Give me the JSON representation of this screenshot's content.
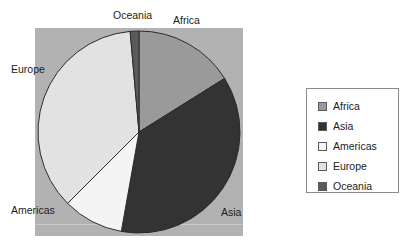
{
  "chart_data": {
    "type": "pie",
    "title": "",
    "labels": [
      "Africa",
      "Asia",
      "Americas",
      "Europe",
      "Oceania"
    ],
    "values": [
      16.1,
      36.7,
      9.7,
      36.1,
      1.4
    ],
    "unit": "percent",
    "start_angle_deg": 0,
    "direction": "clockwise",
    "colors": [
      "#9a9a9a",
      "#333333",
      "#f4f4f4",
      "#e2e2e2",
      "#5a5a5a"
    ],
    "legend_position": "right",
    "grid": false,
    "slice_labels": [
      {
        "name": "Oceania",
        "text": "Oceania"
      },
      {
        "name": "Africa",
        "text": "Africa"
      },
      {
        "name": "Europe",
        "text": "Europe"
      },
      {
        "name": "Americas",
        "text": "Americas"
      },
      {
        "name": "Asia",
        "text": "Asia"
      }
    ]
  },
  "plot": {
    "background_color": "#b2b2b2",
    "center_x": 104,
    "center_y": 104,
    "radius": 101
  },
  "legend": {
    "items": [
      {
        "label": "Africa",
        "color": "#9a9a9a"
      },
      {
        "label": "Asia",
        "color": "#333333"
      },
      {
        "label": "Americas",
        "color": "#f4f4f4"
      },
      {
        "label": "Europe",
        "color": "#e2e2e2"
      },
      {
        "label": "Oceania",
        "color": "#5a5a5a"
      }
    ]
  }
}
